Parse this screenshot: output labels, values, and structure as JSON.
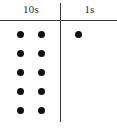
{
  "chart": {
    "columns": [
      {
        "id": "tens",
        "label": "10s",
        "dot_count": 10,
        "dot_columns": 2,
        "dot_rows": 5
      },
      {
        "id": "ones",
        "label": "1s",
        "dot_count": 1,
        "dot_columns": 1,
        "dot_rows": 1
      }
    ],
    "represented_number": "101",
    "colors": {
      "background": "#ffffff",
      "rule": "#3a3a3a",
      "dot": "#111111",
      "text": "#2b2b2b"
    }
  },
  "chart_data": {
    "type": "table",
    "title": "10s",
    "subtitle": "1s",
    "categories": [
      "10s",
      "1s"
    ],
    "values": [
      10,
      1
    ],
    "xlabel": "",
    "ylabel": "",
    "annotations": [
      "10 dots in the 10s column",
      "1 dot in the 1s column"
    ],
    "legend": [],
    "grid": false,
    "dot_positions": {
      "tens": [
        {
          "x": 20,
          "y": 34
        },
        {
          "x": 41,
          "y": 34
        },
        {
          "x": 20,
          "y": 53
        },
        {
          "x": 41,
          "y": 53
        },
        {
          "x": 20,
          "y": 72
        },
        {
          "x": 41,
          "y": 72
        },
        {
          "x": 20,
          "y": 91
        },
        {
          "x": 41,
          "y": 91
        },
        {
          "x": 20,
          "y": 110
        },
        {
          "x": 41,
          "y": 110
        }
      ],
      "ones": [
        {
          "x": 78,
          "y": 34
        }
      ]
    }
  }
}
